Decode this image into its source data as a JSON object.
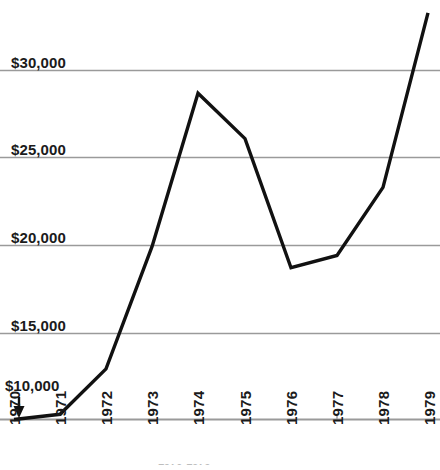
{
  "chart_data": {
    "type": "line",
    "title": "",
    "subtitle": "",
    "xlabel": "",
    "ylabel": "",
    "categories": [
      "1970",
      "1971",
      "1972",
      "1973",
      "1974",
      "1975",
      "1976",
      "1977",
      "1978",
      "1979"
    ],
    "values": [
      10000,
      10300,
      12900,
      19900,
      28700,
      26100,
      18700,
      19400,
      23300,
      33300
    ],
    "series": [
      {
        "name": "",
        "values": [
          10000,
          10300,
          12900,
          19900,
          28700,
          26100,
          18700,
          19400,
          23300,
          33300
        ]
      }
    ],
    "ylim": [
      10000,
      33800
    ],
    "xlim": [
      "1970",
      "1979"
    ],
    "y_tick_labels": [
      "$10,000",
      "$15,000",
      "$20,000",
      "$25,000",
      "$30,000"
    ],
    "y_tick_values": [
      10000,
      15000,
      20000,
      25000,
      30000
    ],
    "x_tick_labels": [
      "1970",
      "1971",
      "1972",
      "1973",
      "1974",
      "1975",
      "1976",
      "1977",
      "1978",
      "1979"
    ],
    "grid": true,
    "grid_orientation": "horizontal",
    "legend": false,
    "legend_position": "none",
    "line_color": "#111111",
    "grid_color": "#9a9a9a",
    "background_color": "#ffffff",
    "annotations": [
      {
        "name": "baseline-arrow",
        "label": "$10,000",
        "points_to_value": 10000,
        "direction": "down"
      }
    ]
  },
  "axis": {
    "y_labels": [
      {
        "text": "$30,000",
        "value": 30000
      },
      {
        "text": "$25,000",
        "value": 25000
      },
      {
        "text": "$20,000",
        "value": 20000
      },
      {
        "text": "$15,000",
        "value": 15000
      }
    ],
    "baseline_label": {
      "text": "$10,000",
      "value": 10000
    },
    "x_labels": [
      {
        "text": "1970"
      },
      {
        "text": "1971"
      },
      {
        "text": "1972"
      },
      {
        "text": "1973"
      },
      {
        "text": "1974"
      },
      {
        "text": "1975"
      },
      {
        "text": "1976"
      },
      {
        "text": "1977"
      },
      {
        "text": "1978"
      },
      {
        "text": "1979"
      }
    ]
  },
  "footer": {
    "cropped_text": "1970-1979"
  }
}
